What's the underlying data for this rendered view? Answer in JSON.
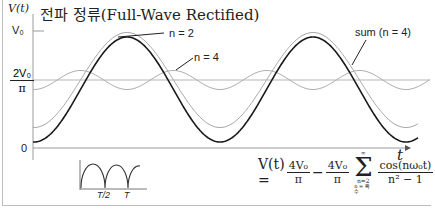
{
  "chart_data": {
    "type": "line",
    "title": "전파 정류(Full-Wave Rectified)",
    "xlabel": "t",
    "ylabel": "V(t)",
    "y_ticks": [
      "V₀",
      "2V₀/π",
      "0"
    ],
    "series": [
      {
        "name": "DC term (2V₀/π)",
        "style": "thin gray horizontal"
      },
      {
        "name": "n = 2",
        "style": "thin gray cosine, period T/2"
      },
      {
        "name": "n = 4",
        "style": "thin gray ripple around 2V₀/π, period T/4"
      },
      {
        "name": "sum (n = 4)",
        "style": "bold dark"
      }
    ],
    "annotations": [
      "n = 2",
      "n = 4",
      "sum  (n = 4)"
    ],
    "inset": {
      "description": "full-wave rectified sine",
      "x_ticks": [
        "T/2",
        "T"
      ]
    },
    "formula": "V(t) = 4V₀/π − 4V₀/π Σ(n=2, n=짝수 → ∞) cos(nω₀t)/(n² − 1)"
  },
  "labels": {
    "ylabel": "V(t)",
    "title": "전파 정류(Full-Wave Rectified)",
    "tick_v0": "V₀",
    "tick_2v0_num": "2V₀",
    "tick_2v0_den": "π",
    "tick_zero": "0",
    "legend_n2": "n = 2",
    "legend_n4": "n = 4",
    "legend_sum": "sum  (n = 4)",
    "t_axis": "t",
    "inset_t2": "T/2",
    "inset_t": "T"
  },
  "formula": {
    "lhs": "V(t) =",
    "f1_num": "4V₀",
    "f1_den": "π",
    "minus": "−",
    "f2_num": "4V₀",
    "f2_den": "π",
    "sigma": "Σ",
    "sum_top": "∞",
    "sum_bottom": "n=2",
    "sum_bottom2": "n = 짝수",
    "f3_num": "cos(nω₀t)",
    "f3_den": "n² − 1"
  },
  "colors": {
    "bold_curve": "#1a1a1a",
    "thin_curve": "#a8a8a8",
    "axis": "#9a9a9a",
    "text": "#222222"
  }
}
